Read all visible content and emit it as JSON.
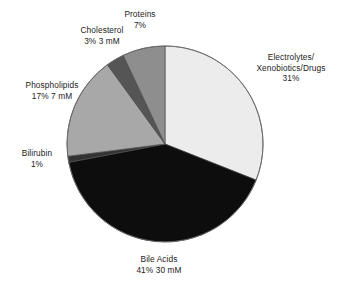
{
  "chart_data": {
    "type": "pie",
    "title": "",
    "subtitle": "",
    "xlabel": "",
    "ylabel": "",
    "legend_position": "callout-labels",
    "grid": false,
    "units": "percent of solutes; concentrations in mM",
    "categories": [
      "Electrolytes/Xenobiotics/Drugs",
      "Bile Acids",
      "Bilirubin",
      "Phospholipids",
      "Cholesterol",
      "Proteins"
    ],
    "values": [
      31,
      41,
      1,
      17,
      3,
      7
    ],
    "concentrations": [
      null,
      "30 mM",
      null,
      "7 mM",
      "3 mM",
      null
    ],
    "colors": [
      "#ececec",
      "#0d0d0d",
      "#333333",
      "#a8a8a8",
      "#555555",
      "#8e8e8e"
    ],
    "start_angle_deg": 0,
    "direction": "clockwise",
    "slices": [
      {
        "id": "electrolytes",
        "label_lines": [
          "Electrolytes/",
          "Xenobiotics/Drugs"
        ],
        "percent_text": "31%",
        "concentration_text": "",
        "value": 31,
        "color": "#ececec"
      },
      {
        "id": "bile-acids",
        "label_lines": [
          "Bile Acids"
        ],
        "percent_text": "41%",
        "concentration_text": "30 mM",
        "value": 41,
        "color": "#0d0d0d"
      },
      {
        "id": "bilirubin",
        "label_lines": [
          "Bilirubin"
        ],
        "percent_text": "1%",
        "concentration_text": "",
        "value": 1,
        "color": "#333333"
      },
      {
        "id": "phospholipids",
        "label_lines": [
          "Phospholipids"
        ],
        "percent_text": "17%",
        "concentration_text": "7 mM",
        "value": 17,
        "color": "#a8a8a8"
      },
      {
        "id": "cholesterol",
        "label_lines": [
          "Cholesterol"
        ],
        "percent_text": "3%",
        "concentration_text": "3 mM",
        "value": 3,
        "color": "#555555"
      },
      {
        "id": "proteins",
        "label_lines": [
          "Proteins"
        ],
        "percent_text": "7%",
        "concentration_text": "",
        "value": 7,
        "color": "#8e8e8e"
      }
    ]
  },
  "labels": {
    "proteins": {
      "name": "Proteins",
      "values": "7%"
    },
    "cholesterol": {
      "name": "Cholesterol",
      "values": "3%  3 mM"
    },
    "phospholipids": {
      "name": "Phospholipids",
      "values": "17%  7 mM"
    },
    "bilirubin": {
      "name": "Bilirubin",
      "values": "1%"
    },
    "electrolytes": {
      "line1": "Electrolytes/",
      "line2": "Xenobiotics/Drugs",
      "values": "31%"
    },
    "bileacids": {
      "name": "Bile Acids",
      "values": "41%  30 mM"
    }
  },
  "geometry": {
    "center_x": 165,
    "center_y": 144,
    "radius": 98
  }
}
